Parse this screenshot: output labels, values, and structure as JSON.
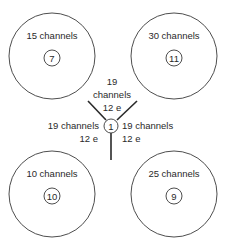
{
  "cells": [
    {
      "id": "cell-7",
      "label": "15 channels",
      "number": "7",
      "cx": 52,
      "cy": 56
    },
    {
      "id": "cell-11",
      "label": "30 channels",
      "number": "11",
      "cx": 174,
      "cy": 56
    },
    {
      "id": "cell-10",
      "label": "10 channels",
      "number": "10",
      "cx": 52,
      "cy": 194
    },
    {
      "id": "cell-9",
      "label": "25 channels",
      "number": "9",
      "cx": 174,
      "cy": 194
    }
  ],
  "center": {
    "number": "1",
    "top": {
      "line1": "19",
      "line2": "channels",
      "line3": "12 e"
    },
    "left": {
      "line1": "19 channels",
      "line2": "12 e"
    },
    "right": {
      "line1": "19 channels",
      "line2": "12 e"
    }
  }
}
